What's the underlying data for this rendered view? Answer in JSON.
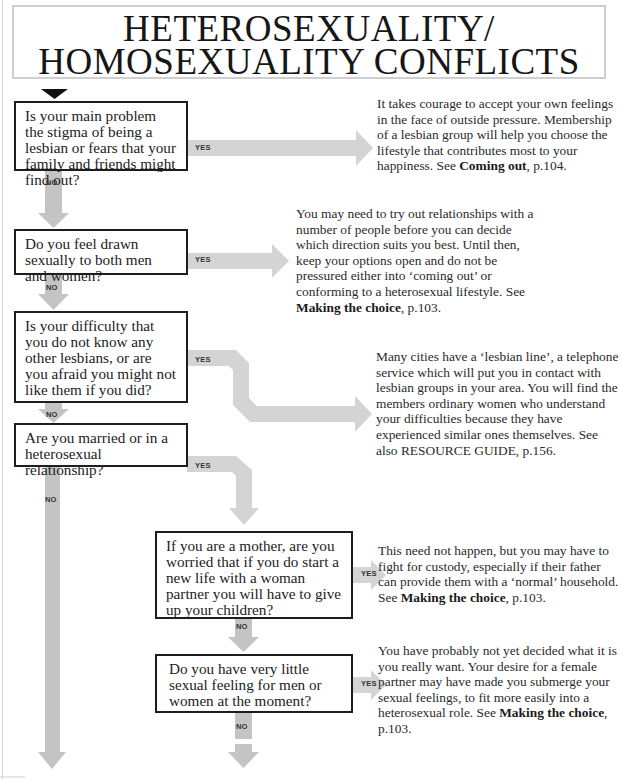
{
  "title": {
    "line1": "HETEROSEXUALITY/",
    "line2": "HOMOSEXUALITY CONFLICTS"
  },
  "colors": {
    "arrow": "#d3d3d3",
    "arrow_dark": "#bdbdbd",
    "box_border": "#1d1d1d",
    "title_border": "#cfcfcf"
  },
  "labels": {
    "yes": "YES",
    "no": "NO"
  },
  "questions": [
    {
      "id": "q1",
      "text": "Is your main problem the stigma of being a lesbian or fears that your family and friends might find out?"
    },
    {
      "id": "q2",
      "text": "Do you feel drawn sexually to both men and women?"
    },
    {
      "id": "q3",
      "text": "Is your difficulty that you do not know any other lesbians, or are you afraid you might not like them if you did?"
    },
    {
      "id": "q4",
      "text": "Are you married or in a heterosexual relationship?"
    },
    {
      "id": "q5",
      "text": "If you are a mother, are you worried that if you do start a new life with a woman partner you will have to give up your children?"
    },
    {
      "id": "q6",
      "text": "Do you have very little sexual feeling for men or women at the moment?"
    }
  ],
  "answers": [
    {
      "id": "a1",
      "text": "It takes courage to accept your own feelings in the face of outside pressure. Membership of a lesbian group will help you choose the lifestyle that contributes most to your happiness. See ",
      "ref": "Coming out",
      "page": ", p.104."
    },
    {
      "id": "a2",
      "text": "You may need to try out relationships with a number of people before you can decide which direction suits you best. Until then, keep your options open and do not be pressured either into ‘coming out’ or conforming to a heterosexual lifestyle. See ",
      "ref": "Making the choice",
      "page": ", p.103."
    },
    {
      "id": "a3",
      "text": "Many cities have a ‘lesbian line’, a telephone service which will put you in contact with lesbian groups in your area. You will find the members ordinary women who understand your difficulties because they have experienced similar ones themselves. See also RESOURCE GUIDE, p.156.",
      "ref": "",
      "page": ""
    },
    {
      "id": "a5",
      "text": "This need not happen, but you may have to fight for custody, especially if their father can provide them with a ‘normal’ household. See ",
      "ref": "Making the choice",
      "page": ", p.103."
    },
    {
      "id": "a6",
      "text": "You have probably not yet decided what it is you really want. Your desire for a female partner may have made you submerge your sexual feelings, to fit more easily into a heterosexual role. See ",
      "ref": "Making the choice",
      "page": ", p.103."
    }
  ]
}
